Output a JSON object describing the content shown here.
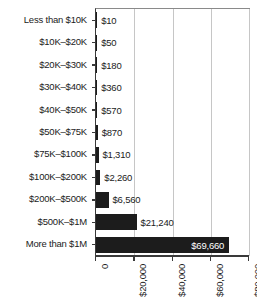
{
  "chart_data": {
    "type": "bar",
    "orientation": "horizontal",
    "title": "",
    "subtitle": "",
    "xlabel": "",
    "ylabel": "",
    "categories": [
      "Less than $10K",
      "$10K–$20K",
      "$20K–$30K",
      "$30K–$40K",
      "$40K–$50K",
      "$50K–$75K",
      "$75K–$100K",
      "$100K–$200K",
      "$200K–$500K",
      "$500K–$1M",
      "More than $1M"
    ],
    "values": [
      10,
      50,
      180,
      360,
      570,
      870,
      1310,
      2260,
      6560,
      21240,
      69660
    ],
    "value_labels": [
      "$10",
      "$50",
      "$180",
      "$360",
      "$570",
      "$870",
      "$1,310",
      "$2,260",
      "$6,560",
      "$21,240",
      "$69,660"
    ],
    "label_placement": [
      "outside",
      "outside",
      "outside",
      "outside",
      "outside",
      "outside",
      "outside",
      "outside",
      "outside",
      "outside",
      "inside"
    ],
    "xlim": [
      0,
      80000
    ],
    "xticks": [
      0,
      20000,
      40000,
      60000,
      80000
    ],
    "xtick_labels": [
      "0",
      "$20,000",
      "$40,000",
      "$60,000",
      "$80,000"
    ],
    "grid": "vertical",
    "legend": "none",
    "bar_color": "#1c1c1c",
    "gridline_color": "#c6c6c6",
    "axis_color": "#3a3a3a",
    "inside_label_color": "#ffffff",
    "outside_label_color": "#1b1b1b",
    "background_color": "#ffffff"
  }
}
